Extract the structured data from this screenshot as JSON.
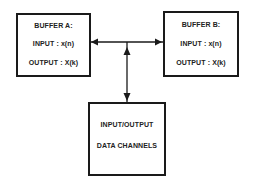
{
  "diagram": {
    "buffer_a": {
      "title": "BUFFER A:",
      "input": "INPUT : x(n)",
      "output": "OUTPUT : X(k)"
    },
    "buffer_b": {
      "title": "BUFFER B:",
      "input": "INPUT : x(n)",
      "output": "OUTPUT : X(k)"
    },
    "io_channels": {
      "line1": "INPUT/OUTPUT",
      "line2": "DATA CHANNELS"
    },
    "connections": [
      {
        "from": "junction",
        "to": "buffer_a",
        "arrow": "left"
      },
      {
        "from": "junction",
        "to": "buffer_b",
        "arrow": "right"
      },
      {
        "from": "io_channels",
        "to": "junction",
        "arrow": "up"
      },
      {
        "from": "junction",
        "to": "io_channels",
        "arrow": "down"
      }
    ],
    "colors": {
      "stroke": "#1a1a1a",
      "background": "#ffffff"
    }
  }
}
